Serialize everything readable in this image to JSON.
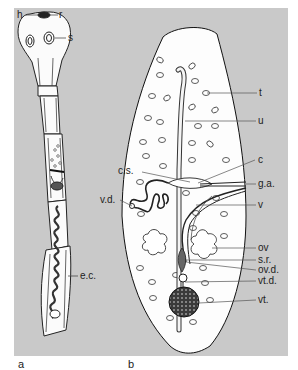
{
  "figure": {
    "background_color": "#c9c9c9",
    "panels": [
      {
        "id": "a",
        "caption": "a",
        "subject": "whole tapeworm strobila",
        "labels": [
          {
            "key": "h",
            "text": "h"
          },
          {
            "key": "r",
            "text": "r"
          },
          {
            "key": "s",
            "text": "s"
          },
          {
            "key": "ec",
            "text": "e.c."
          }
        ]
      },
      {
        "id": "b",
        "caption": "b",
        "subject": "mature proglottid",
        "labels": [
          {
            "key": "t",
            "text": "t"
          },
          {
            "key": "u",
            "text": "u"
          },
          {
            "key": "cs",
            "text": "c.s."
          },
          {
            "key": "c",
            "text": "c"
          },
          {
            "key": "ga",
            "text": "g.a."
          },
          {
            "key": "vd",
            "text": "v.d."
          },
          {
            "key": "v",
            "text": "v"
          },
          {
            "key": "ov",
            "text": "ov"
          },
          {
            "key": "sr",
            "text": "s.r."
          },
          {
            "key": "ovd",
            "text": "ov.d."
          },
          {
            "key": "vtd",
            "text": "vt.d."
          },
          {
            "key": "vt",
            "text": "vt."
          }
        ]
      }
    ]
  },
  "labels": {
    "h": "h",
    "r": "r",
    "s": "s",
    "ec": "e.c.",
    "t": "t",
    "u": "u",
    "cs": "c.s.",
    "c": "c",
    "ga": "g.a.",
    "vd": "v.d.",
    "v": "v",
    "ov": "ov",
    "sr": "s.r.",
    "ovd": "ov.d.",
    "vtd": "vt.d.",
    "vt": "vt.",
    "cap_a": "a",
    "cap_b": "b"
  }
}
